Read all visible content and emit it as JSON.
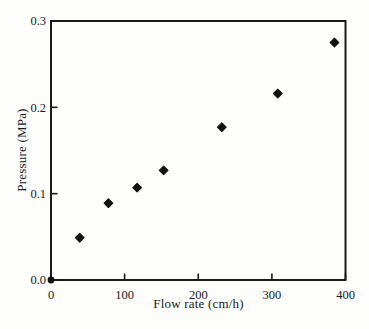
{
  "figure": {
    "kind": "scanned-scatter-plot",
    "background_color": "#fdfdfc",
    "axis_color": "#1a1a1a",
    "marker_color": "#111111"
  },
  "chart_data": {
    "type": "scatter",
    "title": "",
    "xlabel": "Flow rate (cm/h)",
    "ylabel": "Pressure (MPa)",
    "xlim": [
      0,
      400
    ],
    "ylim": [
      0,
      0.3
    ],
    "xticks": [
      0,
      100,
      200,
      300,
      400
    ],
    "xtick_labels": [
      "0",
      "100",
      "200",
      "300",
      "400"
    ],
    "yticks": [
      0,
      0.1,
      0.2,
      0.3
    ],
    "ytick_labels": [
      "0.0",
      "0.1",
      "0.2",
      "0.3"
    ],
    "grid": false,
    "legend": false,
    "marker_shape": "diamond",
    "points": [
      {
        "x": 39,
        "y": 0.049
      },
      {
        "x": 78,
        "y": 0.089
      },
      {
        "x": 117,
        "y": 0.107
      },
      {
        "x": 153,
        "y": 0.127
      },
      {
        "x": 232,
        "y": 0.177
      },
      {
        "x": 308,
        "y": 0.216
      },
      {
        "x": 385,
        "y": 0.275
      }
    ],
    "origin_marker": {
      "x": 0,
      "y": 0,
      "shape": "dot"
    }
  }
}
